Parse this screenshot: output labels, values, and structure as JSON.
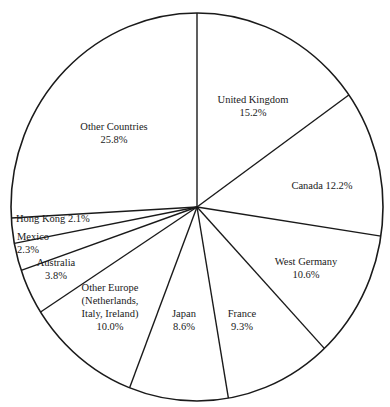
{
  "chart_data": {
    "type": "pie",
    "title": "",
    "start_angle_deg": 0,
    "direction": "clockwise",
    "slices": [
      {
        "label": "United Kingdom",
        "value": 15.2,
        "text_lines": [
          "United Kingdom",
          "15.2%"
        ],
        "label_pos": [
          253,
          103
        ]
      },
      {
        "label": "Canada",
        "value": 12.2,
        "text_lines": [
          "Canada 12.2%"
        ],
        "label_pos": [
          322,
          189
        ]
      },
      {
        "label": "West Germany",
        "value": 10.6,
        "text_lines": [
          "West Germany",
          "10.6%"
        ],
        "label_pos": [
          306,
          265
        ]
      },
      {
        "label": "France",
        "value": 9.3,
        "text_lines": [
          "France",
          "9.3%"
        ],
        "label_pos": [
          242,
          317
        ]
      },
      {
        "label": "Japan",
        "value": 8.6,
        "text_lines": [
          "Japan",
          "8.6%"
        ],
        "label_pos": [
          184,
          317
        ]
      },
      {
        "label": "Other Europe (Netherlands, Italy, Ireland)",
        "value": 10.0,
        "text_lines": [
          "Other Europe",
          "(Netherlands,",
          "Italy, Ireland)",
          "10.0%"
        ],
        "label_pos": [
          110,
          291
        ]
      },
      {
        "label": "Australia",
        "value": 3.8,
        "text_lines": [
          "Australia",
          "3.8%"
        ],
        "label_pos": [
          56,
          266
        ]
      },
      {
        "label": "Mexico",
        "value": 2.3,
        "text_lines": [
          "Mexico",
          "2.3%"
        ],
        "label_pos": [
          17,
          240
        ],
        "anchor": "start"
      },
      {
        "label": "Hong Kong",
        "value": 2.1,
        "text_lines": [
          "Hong Kong 2.1%"
        ],
        "label_pos": [
          16,
          222
        ],
        "anchor": "start"
      },
      {
        "label": "Other Countries",
        "value": 25.8,
        "text_lines": [
          "Other Countries",
          "25.8%"
        ],
        "label_pos": [
          114,
          130
        ]
      }
    ],
    "units": "%",
    "legend": "none (labels inside slices)"
  }
}
